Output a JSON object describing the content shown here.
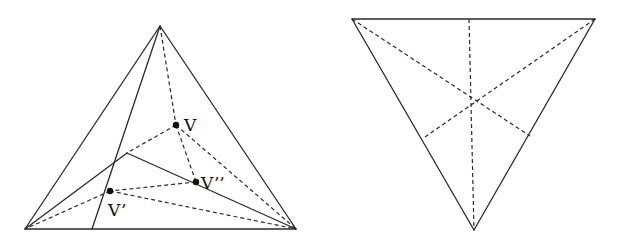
{
  "figures": [
    {
      "id": "left",
      "description": "Triangle with interior points V, V', V'' and solid/dashed segments",
      "vertices": {
        "top": [
          160,
          26
        ],
        "bottom_left": [
          25,
          229
        ],
        "bottom_right": [
          296,
          229
        ],
        "inner": [
          127,
          153
        ],
        "base_foot": [
          92,
          229
        ]
      },
      "points": [
        {
          "name": "V",
          "label": "V",
          "pos": [
            176,
            125
          ],
          "label_pos": [
            184,
            131
          ]
        },
        {
          "name": "V-double-prime",
          "label": "V’’",
          "pos": [
            196,
            182
          ],
          "label_pos": [
            201,
            189
          ]
        },
        {
          "name": "V-prime",
          "label": "V’",
          "pos": [
            110,
            191
          ],
          "label_pos": [
            108,
            216
          ]
        }
      ],
      "solid_segments": [
        [
          [
            160,
            26
          ],
          [
            25,
            229
          ]
        ],
        [
          [
            160,
            26
          ],
          [
            296,
            229
          ]
        ],
        [
          [
            25,
            229
          ],
          [
            296,
            229
          ]
        ],
        [
          [
            160,
            26
          ],
          [
            92,
            229
          ]
        ],
        [
          [
            25,
            229
          ],
          [
            127,
            153
          ]
        ],
        [
          [
            127,
            153
          ],
          [
            296,
            229
          ]
        ]
      ],
      "dashed_segments": [
        [
          [
            160,
            26
          ],
          [
            176,
            125
          ]
        ],
        [
          [
            176,
            125
          ],
          [
            127,
            153
          ]
        ],
        [
          [
            176,
            125
          ],
          [
            196,
            182
          ]
        ],
        [
          [
            176,
            125
          ],
          [
            296,
            229
          ]
        ],
        [
          [
            196,
            182
          ],
          [
            110,
            191
          ]
        ],
        [
          [
            110,
            191
          ],
          [
            25,
            229
          ]
        ],
        [
          [
            110,
            191
          ],
          [
            296,
            229
          ]
        ]
      ]
    },
    {
      "id": "right",
      "description": "Inverted triangle with dashed medians meeting at the center",
      "vertices": {
        "top_left": [
          352,
          19
        ],
        "top_right": [
          595,
          19
        ],
        "bottom": [
          474,
          230
        ],
        "center": [
          469,
          97
        ]
      },
      "solid_segments": [
        [
          [
            352,
            19
          ],
          [
            595,
            19
          ]
        ],
        [
          [
            352,
            19
          ],
          [
            474,
            230
          ]
        ],
        [
          [
            595,
            19
          ],
          [
            474,
            230
          ]
        ]
      ],
      "dashed_segments": [
        [
          [
            469,
            19
          ],
          [
            474,
            230
          ]
        ],
        [
          [
            352,
            19
          ],
          [
            530,
            136
          ]
        ],
        [
          [
            595,
            19
          ],
          [
            425,
            137
          ]
        ]
      ]
    }
  ],
  "labels": {
    "v": "V",
    "v_prime": "V’",
    "v_double_prime": "V’’"
  }
}
